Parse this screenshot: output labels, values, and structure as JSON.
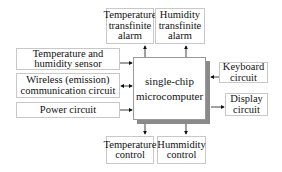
{
  "diagram": {
    "center": {
      "line1": "single-chip",
      "line2": "microcomputer"
    },
    "top": [
      {
        "lines": [
          "Temperature",
          "transfinite",
          "alarm"
        ]
      },
      {
        "lines": [
          "Humidity",
          "transfinite",
          "alarm"
        ]
      }
    ],
    "left": [
      {
        "lines": [
          "Temperature and",
          "humidity sensor"
        ]
      },
      {
        "lines": [
          "Wireless (emission)",
          "communication circuit"
        ]
      },
      {
        "lines": [
          "Power circuit"
        ]
      }
    ],
    "right": [
      {
        "lines": [
          "Keyboard",
          "circuit"
        ]
      },
      {
        "lines": [
          "Display",
          "circuit"
        ]
      }
    ],
    "bottom": [
      {
        "lines": [
          "Temperature",
          "control"
        ]
      },
      {
        "lines": [
          "Hummidity",
          "control"
        ]
      }
    ],
    "colors": {
      "border": "#c8c8c8",
      "shadow": "#8a8a8a",
      "line": "#111111"
    }
  }
}
